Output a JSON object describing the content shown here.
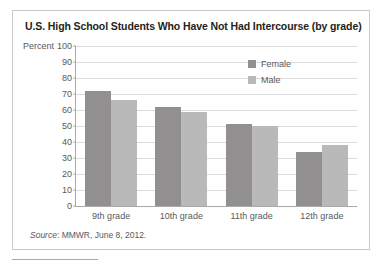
{
  "figure": {
    "title": "U.S. High School Students Who Have Not Had Intercourse (by grade)",
    "source_prefix": "Source",
    "source_text": ": MMWR, June 8, 2012."
  },
  "colors": {
    "female_bar": "#918f90",
    "male_bar": "#b9b9ba",
    "gridline": "#d9dadb",
    "axis": "#a7a9ac",
    "text": "#58595b",
    "title_text": "#231f20",
    "border": "#c8c8c8",
    "background": "#ffffff"
  },
  "chart_data": {
    "type": "bar",
    "title": "U.S. High School Students Who Have Not Had Intercourse (by grade)",
    "xlabel": "",
    "ylabel": "Percent",
    "ylim": [
      0,
      100
    ],
    "ytick_step": 10,
    "yticks": [
      100,
      90,
      80,
      70,
      60,
      50,
      40,
      30,
      20,
      10,
      0
    ],
    "grid": true,
    "legend_position": "top-right",
    "categories": [
      "9th grade",
      "10th grade",
      "11th grade",
      "12th grade"
    ],
    "series": [
      {
        "name": "Female",
        "color": "#918f90",
        "values": [
          72,
          62,
          51,
          34
        ]
      },
      {
        "name": "Male",
        "color": "#b9b9ba",
        "values": [
          66,
          59,
          50,
          38
        ]
      }
    ]
  }
}
